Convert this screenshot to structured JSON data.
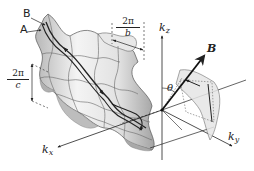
{
  "figure": {
    "labels": {
      "orbit_b": "B",
      "orbit_a": "A",
      "field_b": "B",
      "theta": "θ",
      "kz": "k",
      "kz_sub": "z",
      "kx": "k",
      "kx_sub": "x",
      "ky": "k",
      "ky_sub": "y"
    },
    "period_b": {
      "numerator": "2π",
      "denominator": "b"
    },
    "period_c": {
      "numerator": "2π",
      "denominator": "c"
    }
  },
  "colors": {
    "ink": "#222222",
    "surface_light": "#f2f2f2",
    "surface_mid": "#d0d0d0",
    "surface_dark": "#a8a8a8",
    "background": "#ffffff"
  }
}
